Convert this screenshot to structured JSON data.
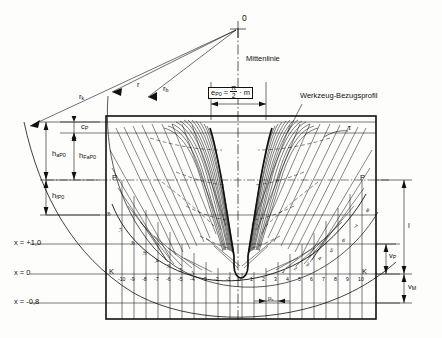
{
  "diagram": {
    "center_label": "0",
    "centerline_label": "Mittenlinie",
    "tool_profile_label": "Werkzeug-Bezugsprofil",
    "tau_label": "τ",
    "tooth_thickness": {
      "symbol": "e",
      "subscript": "P0",
      "equals": "=",
      "numerator": "π",
      "denominator": "2",
      "factor": "· m",
      "full": "e_P0 = π/2 · m"
    },
    "radii": [
      {
        "name": "r-k",
        "symbol": "r",
        "subscript": "k"
      },
      {
        "name": "r",
        "symbol": "r",
        "subscript": ""
      },
      {
        "name": "r-b",
        "symbol": "r",
        "subscript": "b"
      }
    ],
    "left_dimensions": [
      {
        "name": "c-P",
        "symbol": "c",
        "subscript": "P"
      },
      {
        "name": "h-aP0",
        "symbol": "h",
        "subscript": "aP0"
      },
      {
        "name": "h-FaP0",
        "symbol": "h",
        "subscript": "FaP0"
      },
      {
        "name": "h-fP0",
        "symbol": "h",
        "subscript": "fP0"
      }
    ],
    "right_dimensions": [
      {
        "name": "l",
        "symbol": "l",
        "subscript": ""
      },
      {
        "name": "v-P",
        "symbol": "v",
        "subscript": "P"
      },
      {
        "name": "v-M",
        "symbol": "v",
        "subscript": "M"
      }
    ],
    "bottom_dimension": {
      "name": "p-s",
      "symbol": "p",
      "subscript": "s"
    },
    "profile_shift_axis": [
      {
        "name": "x-plus-1",
        "label": "x = +1,0",
        "value": 1.0,
        "y": 244
      },
      {
        "name": "x-zero",
        "label": "x = 0",
        "value": 0.0,
        "y": 274
      },
      {
        "name": "x-minus-08",
        "label": "x = -0,8",
        "value": -0.8,
        "y": 303
      }
    ],
    "row_markers": {
      "pitch_line": "P",
      "rolling_line": "K"
    },
    "cut_numbers": [
      "-10",
      "-9",
      "-8",
      "-7",
      "-6",
      "-5",
      "-4",
      "-3",
      "-2",
      "-1",
      "0",
      "1",
      "2",
      "3",
      "4",
      "5",
      "6",
      "7",
      "8",
      "9",
      "10"
    ],
    "arc_numbers_left": [
      "-8",
      "-7",
      "-6",
      "-5",
      "-4",
      "-3",
      "-2",
      "-1"
    ],
    "arc_numbers_right": [
      "8",
      "7",
      "6",
      "5",
      "4",
      "3",
      "2",
      "1"
    ],
    "colors": {
      "ink": "#111111",
      "paper": "#fdfdfb",
      "thin": "#333333",
      "envelope": "#000000"
    }
  }
}
